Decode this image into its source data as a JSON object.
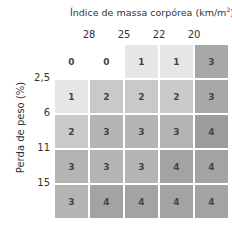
{
  "chart_data": {
    "type": "heatmap",
    "xlabel": "Índice de massa corpórea (km/m²)",
    "ylabel": "Perda de peso (%)",
    "x_ticks": [
      "28",
      "25",
      "22",
      "20"
    ],
    "y_ticks": [
      "2,5",
      "6",
      "11",
      "15"
    ],
    "values": [
      [
        0,
        0,
        1,
        1,
        3
      ],
      [
        1,
        2,
        2,
        2,
        3
      ],
      [
        2,
        3,
        3,
        3,
        4
      ],
      [
        3,
        3,
        3,
        4,
        4
      ],
      [
        3,
        4,
        4,
        4,
        4
      ]
    ],
    "colors": {
      "0": "#ffffff",
      "1": "#e6e6e6",
      "2": "#c9c9c9",
      "3": "#b4b4b4",
      "4": "#a3a3a3"
    },
    "special_colors": {
      "0,4": "#a8a8a8",
      "1,4": "#a8a8a8",
      "2,4": "#9c9c9c"
    }
  },
  "labels": {
    "title_main": "Índice de massa corpórea (km/m",
    "title_sup": "2",
    "title_end": ")",
    "ylabel": "Perda de peso (%)",
    "cols": [
      "28",
      "25",
      "22",
      "20"
    ],
    "rows": [
      "2,5",
      "6",
      "11",
      "15"
    ]
  }
}
